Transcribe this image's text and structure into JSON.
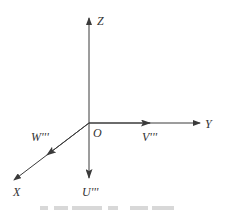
{
  "diagram": {
    "type": "3d-coordinate-axes",
    "origin_label": "O",
    "axes": [
      {
        "id": "z",
        "label": "Z",
        "direction": "up"
      },
      {
        "id": "y",
        "label": "Y",
        "direction": "right"
      },
      {
        "id": "x",
        "label": "X",
        "direction": "down-left"
      }
    ],
    "vectors": [
      {
        "id": "v",
        "label": "V'''",
        "along": "Y",
        "direction": "right"
      },
      {
        "id": "w",
        "label": "W'''",
        "along": "X",
        "direction": "down-left"
      },
      {
        "id": "u",
        "label": "U'''",
        "along": "-Z",
        "direction": "down"
      }
    ],
    "colors": {
      "line": "#3a3a3a",
      "text": "#333333",
      "background": "#ffffff"
    }
  }
}
